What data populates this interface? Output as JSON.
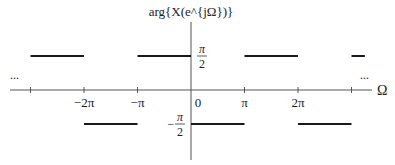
{
  "chart_data": {
    "type": "line",
    "title": "",
    "ylabel": "arg{X(e^{jΩ})}",
    "xlabel": "Ω",
    "x_unit": "π",
    "xlim": [
      -3.3,
      3.4
    ],
    "ylim": [
      -1,
      1
    ],
    "x_ticks": [
      {
        "value": -3,
        "label": ""
      },
      {
        "value": -2,
        "label": "−2π"
      },
      {
        "value": -1,
        "label": "−π"
      },
      {
        "value": 0,
        "label": "0"
      },
      {
        "value": 1,
        "label": "π"
      },
      {
        "value": 2,
        "label": "2π"
      },
      {
        "value": 3,
        "label": ""
      }
    ],
    "y_ticks": [
      {
        "value": 0.5,
        "label_num": "π",
        "label_den": "2",
        "sign": ""
      },
      {
        "value": -0.5,
        "label_num": "π",
        "label_den": "2",
        "sign": "−"
      }
    ],
    "segments": [
      {
        "x0": -3,
        "x1": -2,
        "y": 0.5
      },
      {
        "x0": -2,
        "x1": -1,
        "y": -0.5
      },
      {
        "x0": -1,
        "x1": 0,
        "y": 0.5
      },
      {
        "x0": 0,
        "x1": 1,
        "y": -0.5
      },
      {
        "x0": 1,
        "x1": 2,
        "y": 0.5
      },
      {
        "x0": 2,
        "x1": 3,
        "y": -0.5
      },
      {
        "x0": 3,
        "x1": 3.25,
        "y": 0.5
      }
    ],
    "y_units_note": "y values in units of π",
    "continuation_markers": [
      "...",
      "..."
    ],
    "grid": false
  }
}
